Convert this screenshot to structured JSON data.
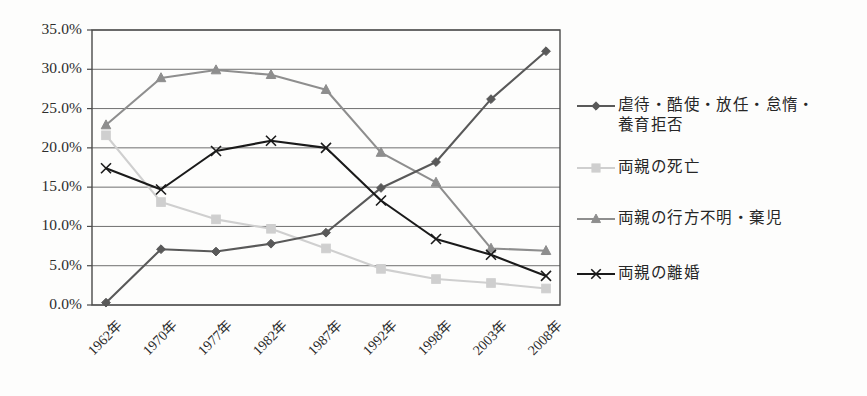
{
  "chart_data": {
    "type": "line",
    "title": "",
    "subtitle": "",
    "xlabel": "",
    "ylabel": "",
    "ylim": [
      0,
      35
    ],
    "ytick_step": 5,
    "grid": "horizontal",
    "legend_position": "right",
    "categories": [
      "1962年",
      "1970年",
      "1977年",
      "1982年",
      "1987年",
      "1992年",
      "1998年",
      "2003年",
      "2008年"
    ],
    "ytick_labels": [
      "35.0%",
      "30.0%",
      "25.0%",
      "20.0%",
      "15.0%",
      "10.0%",
      "5.0%",
      "0.0%"
    ],
    "ytick_values": [
      35.0,
      30.0,
      25.0,
      20.0,
      15.0,
      10.0,
      5.0,
      0.0
    ],
    "series": [
      {
        "name": "虐待・酷使・放任・怠惰・\n養育拒否",
        "marker": "diamond",
        "color": "#595959",
        "values": [
          0.3,
          7.1,
          6.8,
          7.8,
          9.2,
          14.9,
          18.2,
          26.2,
          32.3
        ]
      },
      {
        "name": "両親の死亡",
        "marker": "square",
        "color": "#cfcfcf",
        "values": [
          21.6,
          13.1,
          10.9,
          9.7,
          7.2,
          4.6,
          3.3,
          2.8,
          2.1
        ]
      },
      {
        "name": "両親の行方不明・棄児",
        "marker": "triangle",
        "color": "#8e8e8e",
        "values": [
          22.9,
          28.9,
          29.9,
          29.3,
          27.4,
          19.4,
          15.6,
          7.2,
          6.9
        ]
      },
      {
        "name": "両親の離婚",
        "marker": "x",
        "color": "#1a1a1a",
        "values": [
          17.4,
          14.7,
          19.6,
          20.9,
          20.0,
          13.3,
          8.4,
          6.4,
          3.7
        ]
      }
    ]
  },
  "colors": {
    "gridline": "#6f6f6f",
    "axis": "#4a4a4a",
    "plot_background": "#fdfdfc",
    "text": "#2b2b2b"
  }
}
